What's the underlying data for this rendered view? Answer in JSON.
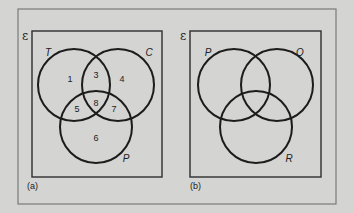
{
  "colors": {
    "background": "#d4d4d2",
    "frame": "#7a7a78",
    "panel_border": "#2e2e2e",
    "circle_stroke": "#1c1c1c",
    "text": "#222222"
  },
  "diagram_a": {
    "caption": "(a)",
    "universal_symbol": "ε",
    "sets": [
      {
        "label": "T",
        "cx": 74,
        "cy": 85,
        "r": 36
      },
      {
        "label": "C",
        "cx": 118,
        "cy": 85,
        "r": 36
      },
      {
        "label": "P",
        "cx": 96,
        "cy": 127,
        "r": 36
      }
    ],
    "regions": [
      {
        "label": "1",
        "x": 70,
        "y": 80
      },
      {
        "label": "3",
        "x": 96,
        "y": 76
      },
      {
        "label": "4",
        "x": 122,
        "y": 80
      },
      {
        "label": "5",
        "x": 77,
        "y": 110
      },
      {
        "label": "8",
        "x": 96,
        "y": 104
      },
      {
        "label": "7",
        "x": 114,
        "y": 110
      },
      {
        "label": "6",
        "x": 96,
        "y": 139
      }
    ]
  },
  "diagram_b": {
    "caption": "(b)",
    "universal_symbol": "ε",
    "sets": [
      {
        "label": "P",
        "cx": 234,
        "cy": 85,
        "r": 36
      },
      {
        "label": "Q",
        "cx": 277,
        "cy": 85,
        "r": 36
      },
      {
        "label": "R",
        "cx": 256,
        "cy": 127,
        "r": 36
      }
    ]
  }
}
